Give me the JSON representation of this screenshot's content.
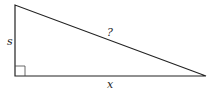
{
  "diagram": {
    "type": "right-triangle",
    "labels": {
      "vertical_side": "s",
      "horizontal_side": "x",
      "hypotenuse": "?"
    },
    "right_angle_marker": true,
    "stroke_color": "#222222",
    "background": "#ffffff"
  }
}
